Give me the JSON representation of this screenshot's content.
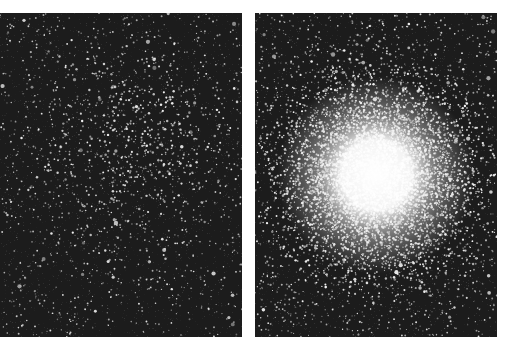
{
  "figure": {
    "background": "#ffffff",
    "panels": [
      {
        "id": "left",
        "subject": "sparse star cluster",
        "sky_color": "#1c1c1c",
        "star_color": "#f2f2f2",
        "cluster_center": [
          0.52,
          0.42
        ],
        "cluster_spread": 0.22,
        "cluster_stars": 650,
        "field_stars": 1100,
        "core_glow": false
      },
      {
        "id": "right",
        "subject": "dense globular cluster",
        "sky_color": "#1c1c1c",
        "star_color": "#f5f5f5",
        "cluster_center": [
          0.5,
          0.5
        ],
        "cluster_spread": 0.2,
        "cluster_stars": 5500,
        "field_stars": 1500,
        "core_glow": true,
        "core_radius": 38
      }
    ]
  }
}
